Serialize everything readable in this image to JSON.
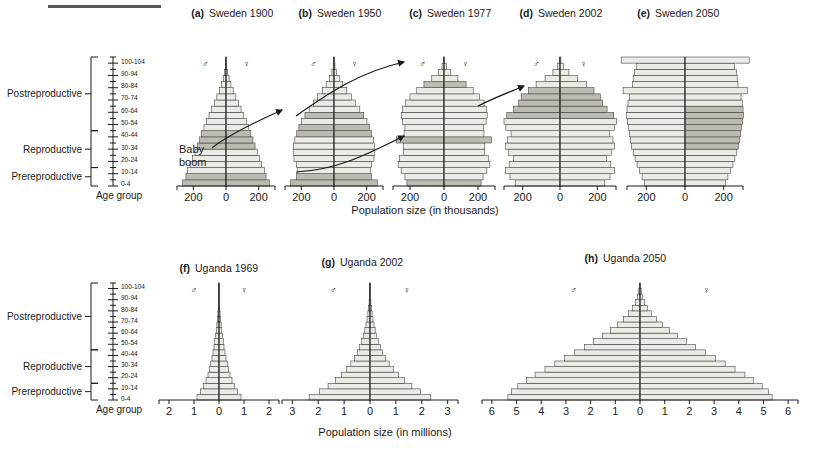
{
  "figure": {
    "top_rule": true,
    "age_axis_label": "Age group",
    "age_ticks": [
      "0-4",
      "10-14",
      "20-24",
      "30-34",
      "40-44",
      "50-54",
      "60-64",
      "70-74",
      "80-84",
      "90-94",
      "100-104"
    ],
    "age_bands": [
      "0-4",
      "5-9",
      "10-14",
      "15-19",
      "20-24",
      "25-29",
      "30-34",
      "35-39",
      "40-44",
      "45-49",
      "50-54",
      "55-59",
      "60-64",
      "65-69",
      "70-74",
      "75-79",
      "80-84",
      "85-89",
      "90-94",
      "95-99",
      "100-104"
    ],
    "brackets": [
      {
        "label": "Prereproductive",
        "from_band": 0,
        "to_band": 2
      },
      {
        "label": "Reproductive",
        "from_band": 3,
        "to_band": 8
      },
      {
        "label": "Postreproductive",
        "from_band": 9,
        "to_band": 20
      }
    ],
    "symbols": {
      "male": "♂",
      "female": "♀"
    },
    "annotation": {
      "line1": "Baby",
      "line2": "boom"
    },
    "colors": {
      "bar_fill": "#eceae4",
      "bar_fill_shaded": "#bdbab2",
      "bar_stroke": "#3a3a3a",
      "axis": "#1a1a1a",
      "text": "#1a1a1a",
      "rule": "#555555"
    }
  },
  "chart_data": [
    {
      "type": "bar",
      "panel": "a",
      "title": "Sweden 1900",
      "xlabel": "Population size (in thousands)",
      "ylabel": "Age group",
      "units": "thousands",
      "xlim": [
        -300,
        300
      ],
      "xticks": [
        -200,
        0,
        200
      ],
      "xtick_labels": [
        "200",
        "0",
        "200"
      ],
      "categories": [
        "0-4",
        "5-9",
        "10-14",
        "15-19",
        "20-24",
        "25-29",
        "30-34",
        "35-39",
        "40-44",
        "45-49",
        "50-54",
        "55-59",
        "60-64",
        "65-69",
        "70-74",
        "75-79",
        "80-84",
        "85-89",
        "90-94",
        "95-99",
        "100-104"
      ],
      "series": [
        {
          "name": "Male",
          "values": [
            265,
            245,
            235,
            218,
            205,
            190,
            175,
            162,
            150,
            135,
            120,
            104,
            88,
            72,
            56,
            40,
            27,
            17,
            9,
            4,
            2
          ]
        },
        {
          "name": "Female",
          "values": [
            265,
            245,
            235,
            218,
            205,
            192,
            178,
            165,
            152,
            138,
            124,
            108,
            92,
            76,
            60,
            44,
            30,
            19,
            10,
            5,
            2
          ]
        }
      ],
      "shaded_bands": [
        0,
        1,
        6,
        7,
        8
      ],
      "grid": false,
      "legend": "none"
    },
    {
      "type": "bar",
      "panel": "b",
      "title": "Sweden 1950",
      "xlabel": "Population size (in thousands)",
      "ylabel": "Age group",
      "units": "thousands",
      "xlim": [
        -300,
        300
      ],
      "xticks": [
        -200,
        0,
        200
      ],
      "xtick_labels": [
        "200",
        "0",
        "200"
      ],
      "categories": [
        "0-4",
        "5-9",
        "10-14",
        "15-19",
        "20-24",
        "25-29",
        "30-34",
        "35-39",
        "40-44",
        "45-49",
        "50-54",
        "55-59",
        "60-64",
        "65-69",
        "70-74",
        "75-79",
        "80-84",
        "85-89",
        "90-94",
        "95-99",
        "100-104"
      ],
      "series": [
        {
          "name": "Male",
          "values": [
            265,
            230,
            222,
            230,
            245,
            250,
            248,
            240,
            228,
            215,
            198,
            178,
            152,
            126,
            100,
            72,
            48,
            28,
            13,
            5,
            2
          ]
        },
        {
          "name": "Female",
          "values": [
            265,
            230,
            222,
            230,
            245,
            250,
            248,
            242,
            230,
            218,
            202,
            182,
            158,
            132,
            106,
            78,
            54,
            32,
            16,
            6,
            2
          ]
        }
      ],
      "shaded_bands": [
        0,
        1,
        8,
        9,
        11
      ],
      "grid": false,
      "legend": "none"
    },
    {
      "type": "bar",
      "panel": "c",
      "title": "Sweden 1977",
      "xlabel": "Population size (in thousands)",
      "ylabel": "Age group",
      "units": "thousands",
      "xlim": [
        -300,
        300
      ],
      "xticks": [
        -200,
        0,
        200
      ],
      "xtick_labels": [
        "200",
        "0",
        "200"
      ],
      "categories": [
        "0-4",
        "5-9",
        "10-14",
        "15-19",
        "20-24",
        "25-29",
        "30-34",
        "35-39",
        "40-44",
        "45-49",
        "50-54",
        "55-59",
        "60-64",
        "65-69",
        "70-74",
        "75-79",
        "80-84",
        "85-89",
        "90-94",
        "95-99",
        "100-104"
      ],
      "series": [
        {
          "name": "Male",
          "values": [
            218,
            230,
            252,
            270,
            262,
            240,
            240,
            280,
            235,
            230,
            245,
            250,
            245,
            228,
            200,
            160,
            118,
            72,
            34,
            12,
            3
          ]
        },
        {
          "name": "Female",
          "values": [
            218,
            230,
            252,
            270,
            262,
            240,
            240,
            280,
            235,
            232,
            248,
            254,
            250,
            236,
            210,
            172,
            130,
            82,
            40,
            15,
            4
          ]
        }
      ],
      "shaded_bands": [
        0,
        7,
        16
      ],
      "grid": false,
      "legend": "none"
    },
    {
      "type": "bar",
      "panel": "d",
      "title": "Sweden 2002",
      "xlabel": "Population size (in thousands)",
      "ylabel": "Age group",
      "units": "thousands",
      "xlim": [
        -300,
        300
      ],
      "xticks": [
        -200,
        0,
        200
      ],
      "xtick_labels": [
        "200",
        "0",
        "200"
      ],
      "categories": [
        "0-4",
        "5-9",
        "10-14",
        "15-19",
        "20-24",
        "25-29",
        "30-34",
        "35-39",
        "40-44",
        "45-49",
        "50-54",
        "55-59",
        "60-64",
        "65-69",
        "70-74",
        "75-79",
        "80-84",
        "85-89",
        "90-94",
        "95-99",
        "100-104"
      ],
      "series": [
        {
          "name": "Male",
          "values": [
            240,
            268,
            292,
            272,
            250,
            275,
            292,
            282,
            262,
            290,
            300,
            285,
            248,
            222,
            208,
            170,
            128,
            80,
            38,
            13,
            4
          ]
        },
        {
          "name": "Female",
          "values": [
            240,
            268,
            292,
            272,
            250,
            275,
            292,
            284,
            265,
            292,
            302,
            288,
            252,
            228,
            216,
            182,
            142,
            94,
            48,
            18,
            5
          ]
        }
      ],
      "shaded_bands": [
        11,
        12,
        13,
        14,
        15
      ],
      "grid": false,
      "legend": "none"
    },
    {
      "type": "bar",
      "panel": "e",
      "title": "Sweden 2050",
      "xlabel": "Population size (in thousands)",
      "ylabel": "Age group",
      "units": "thousands",
      "xlim": [
        -300,
        300
      ],
      "xticks": [
        -200,
        0,
        200
      ],
      "xtick_labels": [
        "200",
        "0",
        "200"
      ],
      "categories": [
        "0-4",
        "5-9",
        "10-14",
        "15-19",
        "20-24",
        "25-29",
        "30-34",
        "35-39",
        "40-44",
        "45-49",
        "50-54",
        "55-59",
        "60-64",
        "65-69",
        "70-74",
        "75-79",
        "80-84",
        "85-89",
        "90-94",
        "95-99",
        "100-104"
      ],
      "series": [
        {
          "name": "Male",
          "values": [
            210,
            222,
            235,
            248,
            258,
            268,
            276,
            282,
            288,
            292,
            298,
            302,
            300,
            295,
            288,
            320,
            272,
            268,
            262,
            250,
            330
          ]
        },
        {
          "name": "Female",
          "values": [
            210,
            222,
            235,
            248,
            258,
            268,
            276,
            282,
            288,
            292,
            298,
            302,
            300,
            296,
            290,
            322,
            274,
            270,
            266,
            255,
            332
          ]
        }
      ],
      "shaded_bands": [
        6,
        7,
        8,
        9,
        10,
        11,
        12
      ],
      "shaded_side": "female",
      "grid": false,
      "legend": "none"
    },
    {
      "type": "bar",
      "panel": "f",
      "title": "Uganda 1969",
      "xlabel": "Population size (in millions)",
      "ylabel": "Age group",
      "units": "millions",
      "xlim": [
        -2.4,
        2.4
      ],
      "xticks": [
        -2,
        -1,
        0,
        1,
        2
      ],
      "xtick_labels": [
        "2",
        "1",
        "0",
        "1",
        "2"
      ],
      "categories": [
        "0-4",
        "5-9",
        "10-14",
        "15-19",
        "20-24",
        "25-29",
        "30-34",
        "35-39",
        "40-44",
        "45-49",
        "50-54",
        "55-59",
        "60-64",
        "65-69",
        "70-74",
        "75-79",
        "80-84",
        "85-89",
        "90-94",
        "95-99",
        "100-104"
      ],
      "series": [
        {
          "name": "Male",
          "values": [
            0.88,
            0.74,
            0.62,
            0.52,
            0.44,
            0.38,
            0.33,
            0.28,
            0.24,
            0.2,
            0.17,
            0.14,
            0.11,
            0.085,
            0.062,
            0.044,
            0.029,
            0.018,
            0.01,
            0.005,
            0.002
          ]
        },
        {
          "name": "Female",
          "values": [
            0.88,
            0.74,
            0.62,
            0.52,
            0.44,
            0.38,
            0.33,
            0.28,
            0.24,
            0.2,
            0.17,
            0.14,
            0.11,
            0.085,
            0.062,
            0.044,
            0.029,
            0.018,
            0.01,
            0.005,
            0.002
          ]
        }
      ],
      "shaded_bands": [],
      "grid": false,
      "legend": "none"
    },
    {
      "type": "bar",
      "panel": "g",
      "title": "Uganda 2002",
      "xlabel": "Population size (in millions)",
      "ylabel": "Age group",
      "units": "millions",
      "xlim": [
        -3.4,
        3.4
      ],
      "xticks": [
        -3,
        -2,
        -1,
        0,
        1,
        2,
        3
      ],
      "xtick_labels": [
        "3",
        "2",
        "1",
        "0",
        "1",
        "2",
        "3"
      ],
      "categories": [
        "0-4",
        "5-9",
        "10-14",
        "15-19",
        "20-24",
        "25-29",
        "30-34",
        "35-39",
        "40-44",
        "45-49",
        "50-54",
        "55-59",
        "60-64",
        "65-69",
        "70-74",
        "75-79",
        "80-84",
        "85-89",
        "90-94",
        "95-99",
        "100-104"
      ],
      "series": [
        {
          "name": "Male",
          "values": [
            2.35,
            1.95,
            1.62,
            1.34,
            1.1,
            0.9,
            0.74,
            0.6,
            0.49,
            0.4,
            0.32,
            0.25,
            0.2,
            0.155,
            0.115,
            0.082,
            0.055,
            0.034,
            0.019,
            0.009,
            0.003
          ]
        },
        {
          "name": "Female",
          "values": [
            2.35,
            1.95,
            1.62,
            1.34,
            1.1,
            0.9,
            0.74,
            0.6,
            0.49,
            0.4,
            0.32,
            0.25,
            0.2,
            0.155,
            0.115,
            0.082,
            0.055,
            0.034,
            0.019,
            0.009,
            0.003
          ]
        }
      ],
      "shaded_bands": [],
      "grid": false,
      "legend": "none"
    },
    {
      "type": "bar",
      "panel": "h",
      "title": "Uganda 2050",
      "xlabel": "Population size (in millions)",
      "ylabel": "Age group",
      "units": "millions",
      "xlim": [
        -6.4,
        6.4
      ],
      "xticks": [
        -6,
        -5,
        -4,
        -3,
        -2,
        -1,
        0,
        1,
        2,
        3,
        4,
        5,
        6
      ],
      "xtick_labels": [
        "6",
        "5",
        "4",
        "3",
        "2",
        "1",
        "0",
        "1",
        "2",
        "3",
        "4",
        "5",
        "6"
      ],
      "categories": [
        "0-4",
        "5-9",
        "10-14",
        "15-19",
        "20-24",
        "25-29",
        "30-34",
        "35-39",
        "40-44",
        "45-49",
        "50-54",
        "55-59",
        "60-64",
        "65-69",
        "70-74",
        "75-79",
        "80-84",
        "85-89",
        "90-94",
        "95-99",
        "100-104"
      ],
      "series": [
        {
          "name": "Male",
          "values": [
            5.35,
            5.2,
            4.95,
            4.6,
            4.25,
            3.85,
            3.45,
            3.05,
            2.65,
            2.25,
            1.88,
            1.52,
            1.2,
            0.92,
            0.67,
            0.46,
            0.3,
            0.18,
            0.1,
            0.05,
            0.02
          ]
        },
        {
          "name": "Female",
          "values": [
            5.35,
            5.2,
            4.95,
            4.6,
            4.25,
            3.85,
            3.45,
            3.05,
            2.65,
            2.25,
            1.88,
            1.52,
            1.2,
            0.92,
            0.67,
            0.46,
            0.3,
            0.18,
            0.1,
            0.05,
            0.02
          ]
        }
      ],
      "shaded_bands": [],
      "grid": false,
      "legend": "none"
    }
  ]
}
